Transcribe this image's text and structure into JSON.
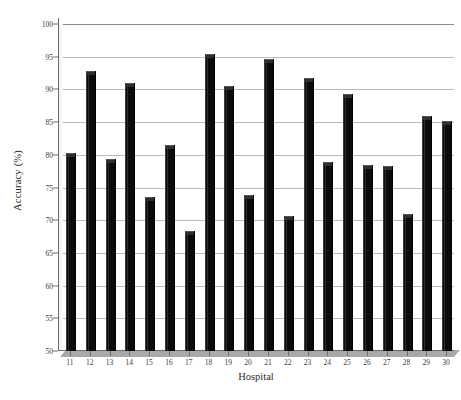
{
  "chart_data": {
    "type": "bar",
    "title": "",
    "xlabel": "Hospital",
    "ylabel": "Accuracy (%)",
    "categories": [
      "11",
      "12",
      "13",
      "14",
      "15",
      "16",
      "17",
      "18",
      "19",
      "20",
      "21",
      "22",
      "23",
      "24",
      "25",
      "26",
      "27",
      "28",
      "29",
      "30"
    ],
    "values": [
      80.3,
      92.8,
      79.4,
      91.0,
      73.5,
      81.5,
      68.3,
      95.4,
      90.5,
      73.9,
      94.6,
      70.6,
      91.8,
      78.9,
      89.3,
      78.4,
      78.3,
      71.0,
      86.0,
      85.2
    ],
    "ylim": [
      50,
      100
    ],
    "yticks": [
      50,
      55,
      60,
      65,
      70,
      75,
      80,
      85,
      90,
      95,
      100
    ],
    "ytick_labels": [
      "50",
      "55",
      "60",
      "65",
      "70",
      "75",
      "80",
      "85",
      "90",
      "95",
      "100"
    ],
    "grid": true,
    "grid_axis": "y",
    "legend": false,
    "legend_position": "none",
    "bar_color": "#0b0b0b",
    "grid_color": "#b9b9b9",
    "axis_color": "#6b6b6b",
    "background_color": "#ffffff",
    "style": "3d-bar"
  }
}
